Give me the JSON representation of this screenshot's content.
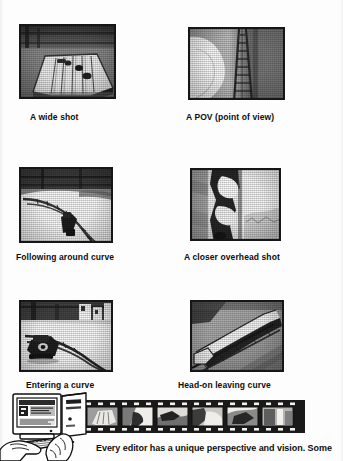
{
  "page": {
    "kind": "scanned-book-page",
    "background_color": "#fdfdfd",
    "ink_color": "#111111"
  },
  "figures": [
    {
      "id": "wide-shot",
      "caption": "A wide shot",
      "subject": "model railroad layout seen from above at a distance",
      "frame": {
        "x": 19,
        "y": 24,
        "w": 97,
        "h": 75
      },
      "caption_pos": {
        "x": 30,
        "y": 112
      }
    },
    {
      "id": "pov",
      "caption": "A POV (point of view)",
      "subject": "point of view along the track looking down the rails",
      "frame": {
        "x": 188,
        "y": 27,
        "w": 97,
        "h": 73
      },
      "caption_pos": {
        "x": 186,
        "y": 112
      }
    },
    {
      "id": "following-curve",
      "caption": "Following around curve",
      "subject": "camera following the train around a curve",
      "frame": {
        "x": 19,
        "y": 167,
        "w": 94,
        "h": 76
      },
      "caption_pos": {
        "x": 16,
        "y": 252
      }
    },
    {
      "id": "closer-overhead",
      "caption": "A closer overhead shot",
      "subject": "close overhead view of the locomotive on track",
      "frame": {
        "x": 190,
        "y": 168,
        "w": 91,
        "h": 73
      },
      "caption_pos": {
        "x": 184,
        "y": 252
      }
    },
    {
      "id": "entering-curve",
      "caption": "Entering a curve",
      "subject": "train entering a curve in the track",
      "frame": {
        "x": 19,
        "y": 300,
        "w": 94,
        "h": 72
      },
      "caption_pos": {
        "x": 26,
        "y": 380
      }
    },
    {
      "id": "head-on-leaving",
      "caption": "Head-on leaving curve",
      "subject": "head-on view of the train leaving the curve",
      "frame": {
        "x": 190,
        "y": 300,
        "w": 94,
        "h": 72
      },
      "caption_pos": {
        "x": 178,
        "y": 380
      }
    }
  ],
  "illustration": {
    "name": "editor-at-computer-with-filmstrip",
    "monitor": {
      "label": "computer monitor showing an editing window"
    },
    "tower": {
      "label": "desktop tower computer case"
    },
    "keyboard": {
      "label": "keyboard with hands typing"
    },
    "filmstrip": {
      "label": "film strip of six frames",
      "frame_count": 6
    }
  },
  "body": {
    "text": "Every editor has a unique perspective and vision. Some"
  }
}
